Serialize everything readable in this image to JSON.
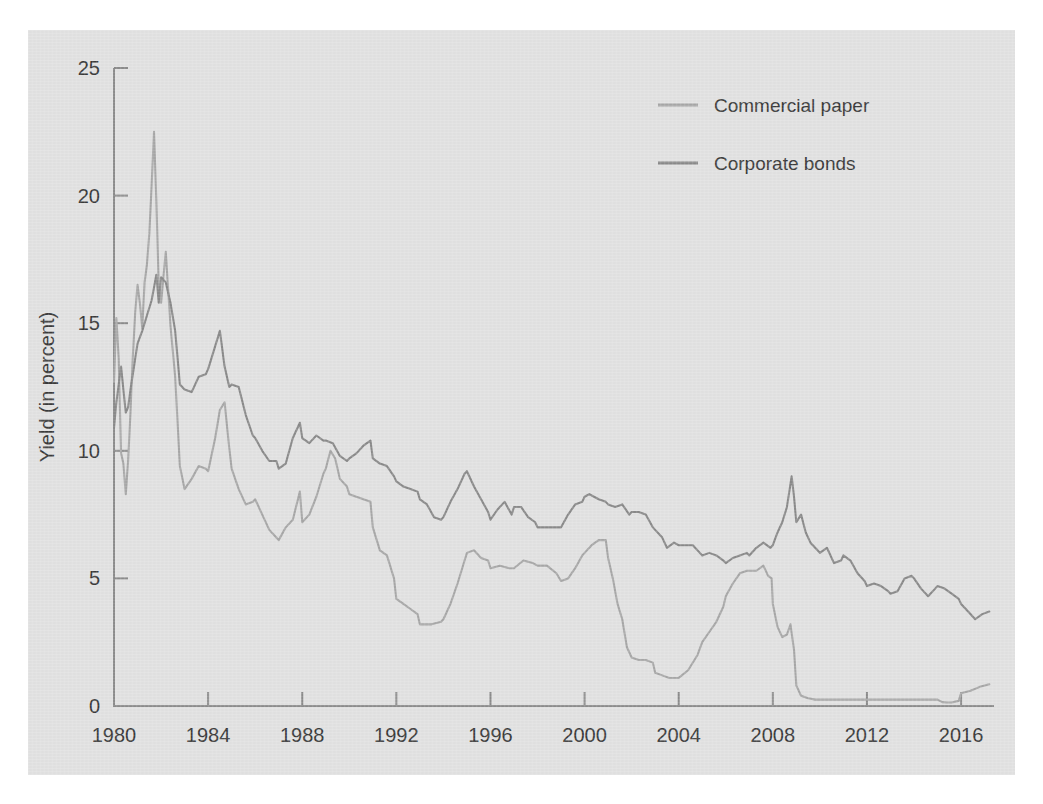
{
  "chart_data": {
    "type": "line",
    "title": "",
    "subtitle": "",
    "xlabel": "",
    "ylabel": "Yield (in percent)",
    "xlim": [
      1980,
      2017.4
    ],
    "ylim": [
      0,
      25
    ],
    "grid": false,
    "legend_position": "top-right",
    "x_ticks": [
      1980,
      1984,
      1988,
      1992,
      1996,
      2000,
      2004,
      2008,
      2012,
      2016
    ],
    "x_tick_labels": [
      "1980",
      "1984",
      "1988",
      "1992",
      "1996",
      "2000",
      "2004",
      "2008",
      "2012",
      "2016"
    ],
    "y_ticks": [
      0,
      5,
      10,
      15,
      20,
      25
    ],
    "y_tick_labels": [
      "0",
      "5",
      "10",
      "15",
      "20",
      "25"
    ],
    "series": [
      {
        "name": "Commercial paper",
        "color": "#a8a8a8",
        "x": [
          1980.0,
          1980.1,
          1980.2,
          1980.3,
          1980.4,
          1980.5,
          1980.6,
          1980.7,
          1980.8,
          1980.9,
          1981.0,
          1981.1,
          1981.2,
          1981.3,
          1981.4,
          1981.5,
          1981.6,
          1981.7,
          1981.8,
          1981.9,
          1982.0,
          1982.2,
          1982.4,
          1982.6,
          1982.8,
          1983.0,
          1983.3,
          1983.6,
          1983.9,
          1984.0,
          1984.3,
          1984.5,
          1984.7,
          1984.9,
          1985.0,
          1985.3,
          1985.6,
          1985.9,
          1986.0,
          1986.3,
          1986.6,
          1986.9,
          1987.0,
          1987.3,
          1987.6,
          1987.9,
          1988.0,
          1988.3,
          1988.6,
          1988.9,
          1989.0,
          1989.2,
          1989.4,
          1989.6,
          1989.9,
          1990.0,
          1990.3,
          1990.6,
          1990.9,
          1991.0,
          1991.3,
          1991.6,
          1991.9,
          1992.0,
          1992.3,
          1992.6,
          1992.9,
          1993.0,
          1993.5,
          1993.9,
          1994.0,
          1994.3,
          1994.6,
          1994.9,
          1995.0,
          1995.3,
          1995.6,
          1995.9,
          1996.0,
          1996.4,
          1996.8,
          1997.0,
          1997.4,
          1997.8,
          1998.0,
          1998.4,
          1998.8,
          1999.0,
          1999.3,
          1999.6,
          1999.9,
          2000.0,
          2000.3,
          2000.6,
          2000.9,
          2001.0,
          2001.2,
          2001.4,
          2001.6,
          2001.8,
          2002.0,
          2002.3,
          2002.6,
          2002.9,
          2003.0,
          2003.3,
          2003.6,
          2003.9,
          2004.0,
          2004.4,
          2004.8,
          2005.0,
          2005.3,
          2005.6,
          2005.9,
          2006.0,
          2006.3,
          2006.6,
          2006.9,
          2007.0,
          2007.3,
          2007.6,
          2007.8,
          2007.95,
          2008.0,
          2008.2,
          2008.4,
          2008.6,
          2008.75,
          2008.9,
          2009.0,
          2009.2,
          2009.5,
          2009.8,
          2010.0,
          2010.3,
          2010.6,
          2010.9,
          2011.0,
          2011.5,
          2011.9,
          2012.0,
          2012.5,
          2012.9,
          2013.0,
          2013.5,
          2013.9,
          2014.0,
          2014.3,
          2014.6,
          2014.9,
          2015.0,
          2015.2,
          2015.4,
          2015.6,
          2015.9,
          2016.0,
          2016.4,
          2016.8,
          2017.2
        ],
        "y": [
          12.7,
          15.2,
          13.6,
          9.9,
          9.5,
          8.3,
          9.6,
          11.5,
          13.7,
          15.4,
          16.5,
          15.8,
          14.8,
          16.6,
          17.3,
          18.5,
          20.4,
          22.5,
          19.8,
          16.5,
          15.8,
          17.8,
          14.9,
          12.9,
          9.4,
          8.5,
          8.9,
          9.4,
          9.3,
          9.2,
          10.5,
          11.6,
          11.9,
          10.1,
          9.3,
          8.5,
          7.9,
          8.0,
          8.1,
          7.5,
          6.9,
          6.6,
          6.5,
          7.0,
          7.3,
          8.4,
          7.2,
          7.5,
          8.2,
          9.1,
          9.3,
          10.0,
          9.7,
          8.9,
          8.6,
          8.3,
          8.2,
          8.1,
          8.0,
          7.0,
          6.1,
          5.9,
          5.0,
          4.2,
          4.0,
          3.8,
          3.6,
          3.2,
          3.2,
          3.3,
          3.4,
          4.0,
          4.8,
          5.7,
          6.0,
          6.1,
          5.8,
          5.7,
          5.4,
          5.5,
          5.4,
          5.4,
          5.7,
          5.6,
          5.5,
          5.5,
          5.2,
          4.9,
          5.0,
          5.4,
          5.9,
          6.0,
          6.3,
          6.5,
          6.5,
          5.8,
          5.0,
          4.0,
          3.4,
          2.3,
          1.9,
          1.8,
          1.8,
          1.7,
          1.3,
          1.2,
          1.1,
          1.1,
          1.1,
          1.4,
          2.0,
          2.5,
          2.9,
          3.3,
          3.9,
          4.3,
          4.8,
          5.2,
          5.3,
          5.3,
          5.3,
          5.5,
          5.1,
          5.0,
          4.0,
          3.1,
          2.7,
          2.8,
          3.2,
          2.2,
          0.8,
          0.4,
          0.3,
          0.25,
          0.25,
          0.25,
          0.25,
          0.25,
          0.25,
          0.25,
          0.25,
          0.25,
          0.25,
          0.25,
          0.25,
          0.25,
          0.25,
          0.25,
          0.25,
          0.25,
          0.25,
          0.25,
          0.15,
          0.14,
          0.14,
          0.2,
          0.5,
          0.6,
          0.75,
          0.85
        ],
        "note": "3-month AA nonfinancial commercial paper yield"
      },
      {
        "name": "Corporate bonds",
        "color": "#8a8a8a",
        "x": [
          1980.0,
          1980.1,
          1980.2,
          1980.3,
          1980.4,
          1980.5,
          1980.6,
          1980.7,
          1980.8,
          1980.9,
          1981.0,
          1981.2,
          1981.4,
          1981.6,
          1981.8,
          1981.9,
          1982.0,
          1982.2,
          1982.4,
          1982.6,
          1982.8,
          1983.0,
          1983.3,
          1983.6,
          1983.9,
          1984.0,
          1984.3,
          1984.5,
          1984.7,
          1984.9,
          1985.0,
          1985.3,
          1985.6,
          1985.9,
          1986.0,
          1986.3,
          1986.6,
          1986.9,
          1987.0,
          1987.3,
          1987.6,
          1987.9,
          1988.0,
          1988.3,
          1988.6,
          1988.9,
          1989.0,
          1989.3,
          1989.6,
          1989.9,
          1990.0,
          1990.3,
          1990.6,
          1990.9,
          1991.0,
          1991.3,
          1991.6,
          1991.9,
          1992.0,
          1992.3,
          1992.6,
          1992.9,
          1993.0,
          1993.3,
          1993.6,
          1993.9,
          1994.0,
          1994.3,
          1994.6,
          1994.9,
          1995.0,
          1995.3,
          1995.6,
          1995.9,
          1996.0,
          1996.3,
          1996.6,
          1996.9,
          1997.0,
          1997.3,
          1997.6,
          1997.9,
          1998.0,
          1998.4,
          1998.8,
          1999.0,
          1999.3,
          1999.6,
          1999.9,
          2000.0,
          2000.2,
          2000.4,
          2000.6,
          2000.9,
          2001.0,
          2001.3,
          2001.6,
          2001.9,
          2002.0,
          2002.3,
          2002.6,
          2002.9,
          2003.0,
          2003.3,
          2003.5,
          2003.8,
          2004.0,
          2004.3,
          2004.6,
          2004.9,
          2005.0,
          2005.3,
          2005.6,
          2005.9,
          2006.0,
          2006.3,
          2006.6,
          2006.9,
          2007.0,
          2007.3,
          2007.6,
          2007.9,
          2008.0,
          2008.2,
          2008.4,
          2008.6,
          2008.8,
          2008.9,
          2009.0,
          2009.2,
          2009.4,
          2009.6,
          2009.9,
          2010.0,
          2010.3,
          2010.6,
          2010.9,
          2011.0,
          2011.3,
          2011.6,
          2011.9,
          2012.0,
          2012.3,
          2012.6,
          2012.9,
          2013.0,
          2013.3,
          2013.6,
          2013.9,
          2014.0,
          2014.3,
          2014.6,
          2014.9,
          2015.0,
          2015.3,
          2015.6,
          2015.9,
          2016.0,
          2016.3,
          2016.6,
          2016.9,
          2017.2
        ],
        "y": [
          10.9,
          11.9,
          12.6,
          13.3,
          12.4,
          11.5,
          11.7,
          12.4,
          13.0,
          13.6,
          14.2,
          14.7,
          15.3,
          15.9,
          16.9,
          15.8,
          16.8,
          16.6,
          15.8,
          14.7,
          12.6,
          12.4,
          12.3,
          12.9,
          13.0,
          13.2,
          14.1,
          14.7,
          13.3,
          12.5,
          12.6,
          12.5,
          11.4,
          10.6,
          10.5,
          10.0,
          9.6,
          9.6,
          9.3,
          9.5,
          10.5,
          11.1,
          10.5,
          10.3,
          10.6,
          10.4,
          10.4,
          10.3,
          9.8,
          9.6,
          9.7,
          9.9,
          10.2,
          10.4,
          9.7,
          9.5,
          9.4,
          9.0,
          8.8,
          8.6,
          8.5,
          8.4,
          8.1,
          7.9,
          7.4,
          7.3,
          7.4,
          8.0,
          8.5,
          9.1,
          9.2,
          8.6,
          8.1,
          7.6,
          7.3,
          7.7,
          8.0,
          7.5,
          7.8,
          7.8,
          7.4,
          7.2,
          7.0,
          7.0,
          7.0,
          7.0,
          7.5,
          7.9,
          8.0,
          8.2,
          8.3,
          8.2,
          8.1,
          8.0,
          7.9,
          7.8,
          7.9,
          7.5,
          7.6,
          7.6,
          7.5,
          7.0,
          6.9,
          6.6,
          6.2,
          6.4,
          6.3,
          6.3,
          6.3,
          6.0,
          5.9,
          6.0,
          5.9,
          5.7,
          5.6,
          5.8,
          5.9,
          6.0,
          5.9,
          6.2,
          6.4,
          6.2,
          6.3,
          6.8,
          7.2,
          7.8,
          9.0,
          8.2,
          7.2,
          7.5,
          6.8,
          6.4,
          6.1,
          6.0,
          6.2,
          5.6,
          5.7,
          5.9,
          5.7,
          5.2,
          4.9,
          4.7,
          4.8,
          4.7,
          4.5,
          4.4,
          4.5,
          5.0,
          5.1,
          5.0,
          4.6,
          4.3,
          4.6,
          4.7,
          4.6,
          4.4,
          4.2,
          4.0,
          3.7,
          3.4,
          3.6,
          3.7
        ],
        "note": "Moody's seasoned Aaa/Baa corporate bond yield"
      }
    ]
  },
  "legend": {
    "items": [
      {
        "label": "Commercial paper",
        "color": "#a8a8a8"
      },
      {
        "label": "Corporate bonds",
        "color": "#8a8a8a"
      }
    ]
  },
  "axes": {
    "y_axis_title": "Yield (in percent)"
  },
  "colors": {
    "background": "#e2e2e2",
    "page": "#ffffff",
    "axis": "#8c8c8c",
    "text": "#3a3a3a",
    "commercial_paper": "#a8a8a8",
    "corporate_bonds": "#8a8a8a"
  }
}
